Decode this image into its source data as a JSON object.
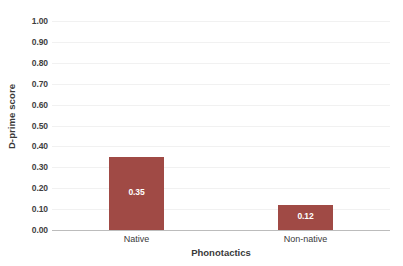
{
  "chart_data": {
    "type": "bar",
    "title": "",
    "xlabel": "Phonotactics",
    "ylabel": "D-prime score",
    "categories": [
      "Native",
      "Non-native"
    ],
    "values": [
      0.35,
      0.12
    ],
    "value_labels": [
      "0.35",
      "0.12"
    ],
    "ylim": [
      0.0,
      1.0
    ],
    "ytick_labels": [
      "1.00",
      "0.90",
      "0.80",
      "0.70",
      "0.60",
      "0.50",
      "0.40",
      "0.30",
      "0.20",
      "0.10",
      "0.00"
    ],
    "ytick_values": [
      1.0,
      0.9,
      0.8,
      0.7,
      0.6,
      0.5,
      0.4,
      0.3,
      0.2,
      0.1,
      0.0
    ],
    "grid": true,
    "grid_axis": "y",
    "legend": false,
    "legend_position": "none",
    "bar_color": "#A04A45",
    "gridline_color": "#F1F1F1",
    "axis_color": "#BCBCBC",
    "text_color": "#3A3A3A",
    "value_label_color": "#FFFFFF",
    "background_color": "#FFFFFF"
  }
}
